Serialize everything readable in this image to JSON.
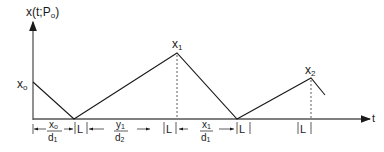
{
  "diagram": {
    "y_axis_label": "x(t;P",
    "y_axis_label_sub": "o",
    "y_axis_label_close": ")",
    "x_axis_label": "t",
    "points": {
      "x0": {
        "main": "x",
        "sub": "o"
      },
      "x1": {
        "main": "x",
        "sub": "1"
      },
      "x2": {
        "main": "x",
        "sub": "2"
      }
    },
    "intervals": [
      {
        "num_main": "x",
        "num_sub": "o",
        "den_main": "d",
        "den_sub": "1"
      },
      {
        "label": "L"
      },
      {
        "num_main": "y",
        "num_sub": "1",
        "den_main": "d",
        "den_sub": "2"
      },
      {
        "label": "L"
      },
      {
        "num_main": "x",
        "num_sub": "1",
        "den_main": "d",
        "den_sub": "1"
      },
      {
        "label": "L"
      },
      {
        "label": "L"
      }
    ],
    "line_color": "#1a1a1a"
  }
}
